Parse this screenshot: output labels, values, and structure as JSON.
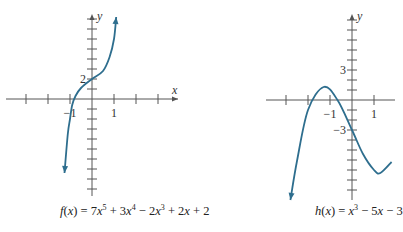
{
  "chart_data": [
    {
      "type": "line",
      "title": "f(x) = 7x^5 + 3x^4 - 2x^3 + 2x + 2",
      "caption_parts": [
        "f",
        "(",
        "x",
        ") = 7",
        "x",
        "5",
        " + 3",
        "x",
        "4",
        " − 2",
        "x",
        "3",
        " + 2",
        "x",
        " + 2"
      ],
      "xlabel": "x",
      "ylabel": "y",
      "x_tick_labels": [
        {
          "value": -1,
          "label": "−1"
        },
        {
          "value": 1,
          "label": "1"
        }
      ],
      "y_tick_labels": [
        {
          "value": 2,
          "label": "2"
        }
      ],
      "xlim": [
        -3,
        3
      ],
      "ylim": [
        -9,
        8
      ],
      "x_ticks": [
        -3,
        -2,
        -1,
        1,
        2,
        3
      ],
      "y_ticks": [
        -9,
        -8,
        -7,
        -6,
        -5,
        -4,
        -3,
        -2,
        -1,
        1,
        2,
        3,
        4,
        5,
        6,
        7,
        8
      ],
      "grid": false,
      "points": [
        {
          "x": -1.25,
          "y": -7.4
        },
        {
          "x": -1.1,
          "y": -3.5
        },
        {
          "x": -1.0,
          "y": -2.0
        },
        {
          "x": -0.9,
          "y": -0.6
        },
        {
          "x": -0.75,
          "y": 0.3
        },
        {
          "x": -0.5,
          "y": 1.1
        },
        {
          "x": 0,
          "y": 2
        },
        {
          "x": 0.5,
          "y": 2.8
        },
        {
          "x": 0.8,
          "y": 4.2
        },
        {
          "x": 1.0,
          "y": 6.0
        },
        {
          "x": 1.1,
          "y": 8.2
        }
      ],
      "color": "#2e6e8e"
    },
    {
      "type": "line",
      "title": "h(x) = x^3 - 5x - 3",
      "caption_parts": [
        "h",
        "(",
        "x",
        ") = ",
        "x",
        "3",
        " − 5",
        "x",
        " − 3"
      ],
      "xlabel": "",
      "ylabel": "y",
      "x_tick_labels": [
        {
          "value": -1,
          "label": "−1"
        },
        {
          "value": 1,
          "label": "1"
        }
      ],
      "y_tick_labels": [
        {
          "value": 3,
          "label": "3"
        },
        {
          "value": -3,
          "label": "−3"
        }
      ],
      "xlim": [
        -3,
        2
      ],
      "ylim": [
        -10,
        8
      ],
      "x_ticks": [
        -3,
        -2,
        -1,
        1,
        2
      ],
      "y_ticks": [
        -10,
        -9,
        -8,
        -7,
        -6,
        -5,
        -4,
        -3,
        -2,
        -1,
        1,
        2,
        3,
        4,
        5,
        6,
        7,
        8
      ],
      "grid": false,
      "points": [
        {
          "x": -2.8,
          "y": -10.0
        },
        {
          "x": -2.5,
          "y": -6.1
        },
        {
          "x": -2.0,
          "y": -1.0
        },
        {
          "x": -1.29,
          "y": 1.3
        },
        {
          "x": -0.66,
          "y": 0.0
        },
        {
          "x": 0,
          "y": -3.0
        },
        {
          "x": 0.5,
          "y": -5.4
        },
        {
          "x": 1.0,
          "y": -7.0
        },
        {
          "x": 1.29,
          "y": -7.3
        },
        {
          "x": 1.8,
          "y": -6.2
        }
      ],
      "color": "#2e6e8e"
    }
  ]
}
